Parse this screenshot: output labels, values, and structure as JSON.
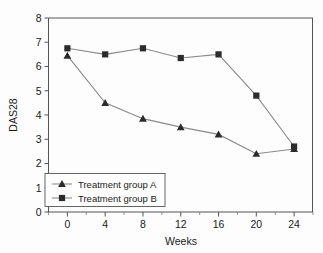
{
  "chart_data": {
    "type": "line",
    "title": "",
    "xlabel": "Weeks",
    "ylabel": "DAS28",
    "x": [
      0,
      4,
      8,
      12,
      16,
      20,
      24
    ],
    "xticklabels": [
      "0",
      "4",
      "8",
      "12",
      "16",
      "20",
      "24"
    ],
    "yticklabels": [
      "0",
      "1",
      "2",
      "3",
      "4",
      "5",
      "6",
      "7",
      "8"
    ],
    "xlim": [
      -2,
      26
    ],
    "ylim": [
      0,
      8
    ],
    "grid": false,
    "legend_position": "lower-left",
    "series": [
      {
        "name": "Treatment group A",
        "marker": "triangle",
        "values": [
          6.45,
          4.5,
          3.85,
          3.5,
          3.2,
          2.4,
          2.6
        ]
      },
      {
        "name": "Treatment group B",
        "marker": "square",
        "values": [
          6.75,
          6.5,
          6.75,
          6.35,
          6.5,
          4.8,
          2.7
        ]
      }
    ]
  },
  "axes": {
    "y_title": "DAS28",
    "x_title": "Weeks",
    "y_ticks": [
      "8",
      "7",
      "6",
      "5",
      "4",
      "3",
      "2",
      "1",
      "0"
    ],
    "x_ticks": [
      "0",
      "4",
      "8",
      "12",
      "16",
      "20",
      "24"
    ]
  },
  "legend": {
    "entries": [
      {
        "label": "Treatment group A",
        "marker": "triangle-marker"
      },
      {
        "label": "Treatment group B",
        "marker": "square-marker"
      }
    ]
  },
  "colors": {
    "line": "#8a8a8a",
    "marker": "#2b2b2b",
    "axis": "#555555",
    "text": "#1a1a1a",
    "background": "#fdfdfd"
  }
}
